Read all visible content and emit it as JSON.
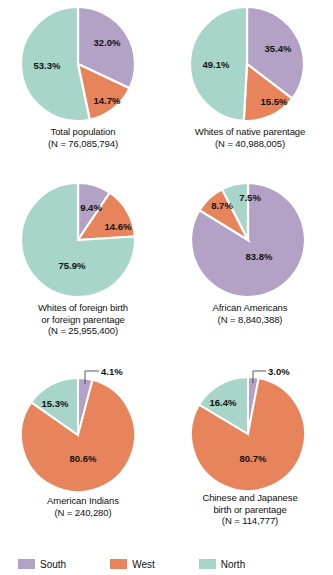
{
  "legend": {
    "items": [
      {
        "label": "South",
        "color": "#b3a2c5"
      },
      {
        "label": "West",
        "color": "#e8845c"
      },
      {
        "label": "North",
        "color": "#a7d5ca"
      }
    ]
  },
  "colors": {
    "south": "#b3a2c5",
    "west": "#e8845c",
    "north": "#a7d5ca",
    "separator": "#ffffff",
    "text": "#111111"
  },
  "charts": [
    {
      "id": "total-population",
      "caption_line1": "Total population",
      "caption_line2": "(N = 76,085,794)",
      "labels": [
        "32.0%",
        "14.7%",
        "53.3%"
      ]
    },
    {
      "id": "whites-native-parentage",
      "caption_line1": "Whites of native parentage",
      "caption_line2": "(N = 40,988,005)",
      "labels": [
        "35.4%",
        "15.5%",
        "49.1%"
      ]
    },
    {
      "id": "whites-foreign-birth-or-parentage",
      "caption_line1": "Whites of foreign birth",
      "caption_line2": "or foreign parentage",
      "caption_line3": "(N = 25,955,400)",
      "labels": [
        "9.4%",
        "14.6%",
        "75.9%"
      ]
    },
    {
      "id": "african-americans",
      "caption_line1": "African Americans",
      "caption_line2": "(N = 8,840,388)",
      "labels": [
        "83.8%",
        "8.7%",
        "7.5%"
      ]
    },
    {
      "id": "american-indians",
      "caption_line1": "American Indians",
      "caption_line2": "(N = 240,280)",
      "labels": [
        "4.1%",
        "80.6%",
        "15.3%"
      ]
    },
    {
      "id": "chinese-and-japanese",
      "caption_line1": "Chinese and Japanese",
      "caption_line2": "birth or parentage",
      "caption_line3": "(N = 114,777)",
      "labels": [
        "3.0%",
        "80.7%",
        "16.4%"
      ]
    }
  ],
  "chart_data": [
    {
      "type": "pie",
      "title": "Total population",
      "subtitle": "(N = 76,085,794)",
      "categories": [
        "South",
        "West",
        "North"
      ],
      "values": [
        32.0,
        14.7,
        53.3
      ],
      "colors": [
        "#b3a2c5",
        "#e8845c",
        "#a7d5ca"
      ],
      "legend_position": "bottom"
    },
    {
      "type": "pie",
      "title": "Whites of native parentage",
      "subtitle": "(N = 40,988,005)",
      "categories": [
        "South",
        "West",
        "North"
      ],
      "values": [
        35.4,
        15.5,
        49.1
      ],
      "colors": [
        "#b3a2c5",
        "#e8845c",
        "#a7d5ca"
      ],
      "legend_position": "bottom"
    },
    {
      "type": "pie",
      "title": "Whites of foreign birth or foreign parentage",
      "subtitle": "(N = 25,955,400)",
      "categories": [
        "South",
        "West",
        "North"
      ],
      "values": [
        9.4,
        14.6,
        75.9
      ],
      "colors": [
        "#b3a2c5",
        "#e8845c",
        "#a7d5ca"
      ],
      "legend_position": "bottom"
    },
    {
      "type": "pie",
      "title": "African Americans",
      "subtitle": "(N = 8,840,388)",
      "categories": [
        "South",
        "West",
        "North"
      ],
      "values": [
        83.8,
        8.7,
        7.5
      ],
      "colors": [
        "#b3a2c5",
        "#e8845c",
        "#a7d5ca"
      ],
      "legend_position": "bottom"
    },
    {
      "type": "pie",
      "title": "American Indians",
      "subtitle": "(N = 240,280)",
      "categories": [
        "South",
        "West",
        "North"
      ],
      "values": [
        4.1,
        80.6,
        15.3
      ],
      "colors": [
        "#b3a2c5",
        "#e8845c",
        "#a7d5ca"
      ],
      "legend_position": "bottom"
    },
    {
      "type": "pie",
      "title": "Chinese and Japanese birth or parentage",
      "subtitle": "(N = 114,777)",
      "categories": [
        "South",
        "West",
        "North"
      ],
      "values": [
        3.0,
        80.7,
        16.4
      ],
      "colors": [
        "#b3a2c5",
        "#e8845c",
        "#a7d5ca"
      ],
      "legend_position": "bottom"
    }
  ]
}
